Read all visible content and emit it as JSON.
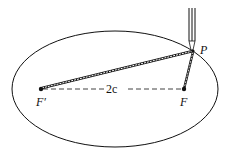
{
  "diagram": {
    "labels": {
      "point_p": "P",
      "focus_f_prime": "F′",
      "focus_f": "F",
      "focal_distance": "2c"
    },
    "colors": {
      "stroke": "#111111",
      "background": "#ffffff"
    }
  }
}
